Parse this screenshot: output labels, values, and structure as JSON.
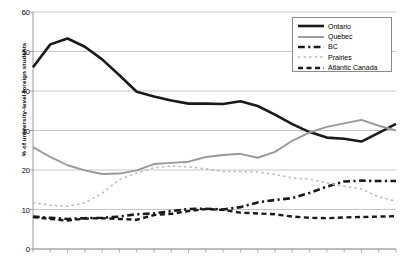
{
  "chart_data": {
    "type": "line",
    "title": "",
    "xlabel": "",
    "ylabel": "% of university-level foreign students",
    "ylim": [
      0,
      60
    ],
    "ytick_values": [
      0,
      10,
      20,
      30,
      40,
      50,
      60
    ],
    "ytick_labels": [
      "0",
      "10",
      "20",
      "30",
      "40",
      "50",
      "60"
    ],
    "grid": "horizontal",
    "legend_position": "top-right",
    "x_tick_count": 22,
    "x_tick_labels": [],
    "x": [
      1,
      2,
      3,
      4,
      5,
      6,
      7,
      8,
      9,
      10,
      11,
      12,
      13,
      14,
      15,
      16,
      17,
      18,
      19,
      20,
      21,
      22
    ],
    "series": [
      {
        "name": "Ontario",
        "style": "solid",
        "width": 2.6,
        "color": "#1a1a1a",
        "values": [
          46.0,
          51.8,
          53.3,
          51.2,
          48.0,
          44.0,
          39.8,
          38.6,
          37.6,
          36.8,
          36.8,
          36.7,
          37.4,
          36.2,
          34.0,
          31.6,
          29.6,
          28.2,
          27.9,
          27.2,
          29.4,
          31.7
        ]
      },
      {
        "name": "Quebec",
        "style": "solid",
        "width": 1.9,
        "color": "#999999",
        "values": [
          25.8,
          23.3,
          21.2,
          19.9,
          19.0,
          19.1,
          19.9,
          21.5,
          21.8,
          22.1,
          23.3,
          23.8,
          24.1,
          23.1,
          24.6,
          27.4,
          29.5,
          30.9,
          31.8,
          32.7,
          31.2,
          30.0
        ]
      },
      {
        "name": "BC",
        "style": "dash-dot",
        "width": 2.6,
        "color": "#1a1a1a",
        "values": [
          8.2,
          7.9,
          7.6,
          7.8,
          7.9,
          8.2,
          8.8,
          9.0,
          9.6,
          10.1,
          10.2,
          10.0,
          10.6,
          11.8,
          12.4,
          12.9,
          14.2,
          15.8,
          17.1,
          17.3,
          17.2,
          17.2
        ]
      },
      {
        "name": "Prairies",
        "style": "dotted",
        "width": 1.5,
        "color": "#b5b5b5",
        "values": [
          11.7,
          11.1,
          10.8,
          11.7,
          14.1,
          17.6,
          19.2,
          20.6,
          21.0,
          20.8,
          20.3,
          19.6,
          19.6,
          19.5,
          18.9,
          18.0,
          17.7,
          16.7,
          15.9,
          15.2,
          13.2,
          12.1
        ]
      },
      {
        "name": "Atlantic Canada",
        "style": "dashed",
        "width": 2.4,
        "color": "#1a1a1a",
        "values": [
          8.1,
          7.6,
          7.2,
          7.7,
          7.8,
          7.6,
          7.4,
          8.6,
          8.9,
          9.6,
          10.1,
          9.9,
          9.2,
          9.0,
          8.8,
          8.2,
          7.9,
          7.8,
          8.0,
          8.1,
          8.2,
          8.3
        ]
      }
    ]
  },
  "legend": {
    "items": [
      {
        "label": "Ontario"
      },
      {
        "label": "Quebec"
      },
      {
        "label": "BC"
      },
      {
        "label": "Prairies"
      },
      {
        "label": "Atlantic Canada"
      }
    ]
  },
  "axes": {
    "y_label": "% of university-level foreign students"
  }
}
